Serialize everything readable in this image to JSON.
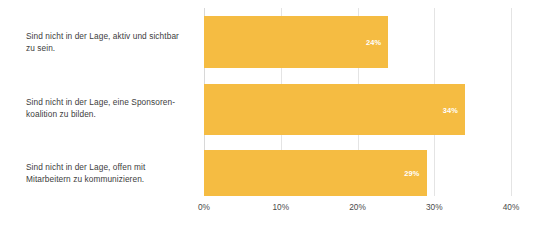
{
  "chart_data": {
    "type": "bar",
    "orientation": "horizontal",
    "title": "",
    "subtitle": "",
    "xlabel": "",
    "ylabel": "",
    "categories": [
      "Sind nicht in der Lage, aktiv und sichtbar zu sein.",
      "Sind nicht in der Lage, eine Sponsoren-koalition zu bilden.",
      "Sind nicht in der Lage, offen mit Mitarbeitern zu kommunizieren."
    ],
    "category_lines": [
      "Sind nicht in der Lage, aktiv und sichtbar\nzu sein.",
      "Sind nicht in der Lage, eine Sponsoren-\nkoalition zu bilden.",
      "Sind nicht in der Lage, offen mit\nMitarbeitern zu kommunizieren."
    ],
    "values": [
      24,
      34,
      29
    ],
    "value_labels": [
      "24%",
      "34%",
      "29%"
    ],
    "xlim": [
      0,
      40
    ],
    "xticks": [
      0,
      10,
      20,
      30,
      40
    ],
    "xtick_labels": [
      "0%",
      "10%",
      "20%",
      "30%",
      "40%"
    ],
    "grid": true,
    "legend": false,
    "colors": {
      "bar": "#f5bc42",
      "value_label": "#ffffff",
      "gridline": "#e4e4e4",
      "axis": "#d8d8d8",
      "category_text": "#3d3d3d",
      "tick_text": "#4a4a4a",
      "background": "#ffffff"
    }
  }
}
